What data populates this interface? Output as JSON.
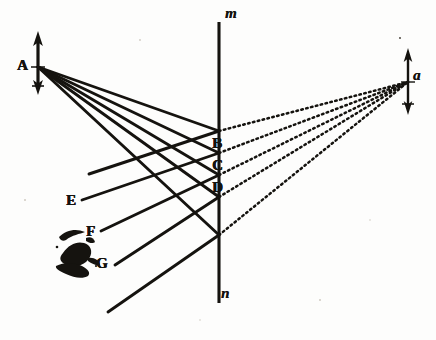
{
  "figure": {
    "kind": "optical-ray-diagram",
    "background_color": "#fdfdfc",
    "ink_color": "#15130f"
  },
  "labels": {
    "object_point": "A",
    "image_point": "a",
    "axis_top": "m",
    "axis_bottom": "n",
    "plane_points": [
      "B",
      "C",
      "D"
    ],
    "left_points": [
      "E",
      "F",
      "G"
    ]
  },
  "label_positions": {
    "A": {
      "x": 17,
      "y": 58,
      "style": "cap"
    },
    "a": {
      "x": 413,
      "y": 68,
      "style": "ital"
    },
    "m": {
      "x": 225,
      "y": 6,
      "style": "ital"
    },
    "n": {
      "x": 221,
      "y": 286,
      "style": "ital"
    },
    "B": {
      "x": 212,
      "y": 136,
      "style": "cap"
    },
    "C": {
      "x": 212,
      "y": 158,
      "style": "cap"
    },
    "D": {
      "x": 212,
      "y": 180,
      "style": "cap"
    },
    "E": {
      "x": 66,
      "y": 193,
      "style": "cap"
    },
    "F": {
      "x": 86,
      "y": 224,
      "style": "cap"
    },
    "G": {
      "x": 96,
      "y": 256,
      "style": "cap"
    }
  },
  "geometry": {
    "object_arrow": {
      "x": 38,
      "y_top": 33,
      "y_bottom": 93,
      "origin_y": 67
    },
    "image_arrow": {
      "x": 408,
      "y_top": 50,
      "y_bottom": 113,
      "origin_y": 82
    },
    "axis_line": {
      "x": 219,
      "y_top": 22,
      "y_bottom": 303
    },
    "incident_rays": [
      {
        "from_x": 38,
        "from_y": 67,
        "to_x": 219,
        "to_y": 131
      },
      {
        "from_x": 38,
        "from_y": 67,
        "to_x": 219,
        "to_y": 153
      },
      {
        "from_x": 38,
        "from_y": 67,
        "to_x": 219,
        "to_y": 175
      },
      {
        "from_x": 38,
        "from_y": 67,
        "to_x": 219,
        "to_y": 197
      },
      {
        "from_x": 38,
        "from_y": 67,
        "to_x": 219,
        "to_y": 235
      }
    ],
    "reflected_rays": [
      {
        "from_x": 219,
        "from_y": 131,
        "to_x": 89,
        "to_y": 174
      },
      {
        "from_x": 219,
        "from_y": 153,
        "to_x": 82,
        "to_y": 200
      },
      {
        "from_x": 219,
        "from_y": 175,
        "to_x": 101,
        "to_y": 231
      },
      {
        "from_x": 219,
        "from_y": 197,
        "to_x": 115,
        "to_y": 265
      },
      {
        "from_x": 219,
        "from_y": 235,
        "to_x": 108,
        "to_y": 312
      }
    ],
    "virtual_rays": [
      {
        "from_x": 219,
        "from_y": 131,
        "to_x": 408,
        "to_y": 82
      },
      {
        "from_x": 219,
        "from_y": 153,
        "to_x": 408,
        "to_y": 82
      },
      {
        "from_x": 219,
        "from_y": 175,
        "to_x": 408,
        "to_y": 82
      },
      {
        "from_x": 219,
        "from_y": 197,
        "to_x": 408,
        "to_y": 82
      },
      {
        "from_x": 219,
        "from_y": 235,
        "to_x": 408,
        "to_y": 82
      }
    ],
    "ink_blot": {
      "cx": 80,
      "cy": 252,
      "rx": 26,
      "ry": 20
    }
  }
}
